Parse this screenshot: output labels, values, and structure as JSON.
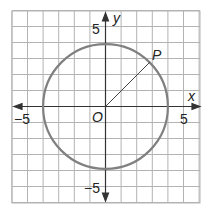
{
  "diagram": {
    "type": "coordinate-plane-circle",
    "grid": {
      "x_min": -6,
      "x_max": 6,
      "y_min": -6,
      "y_max": 6,
      "line_color": "#b3b3b3"
    },
    "axes": {
      "x_label": "x",
      "y_label": "y",
      "tick_labels": {
        "x_neg": "−5",
        "x_pos": "5",
        "y_pos": "5",
        "y_neg": "−5"
      },
      "color": "#333333"
    },
    "circle": {
      "center": [
        0,
        0
      ],
      "radius": 4,
      "color": "#808080"
    },
    "origin_label": "O",
    "point": {
      "label": "P",
      "angle_deg": 45
    },
    "radius_segment": {
      "from": "O",
      "to": "P",
      "color": "#444444"
    }
  }
}
